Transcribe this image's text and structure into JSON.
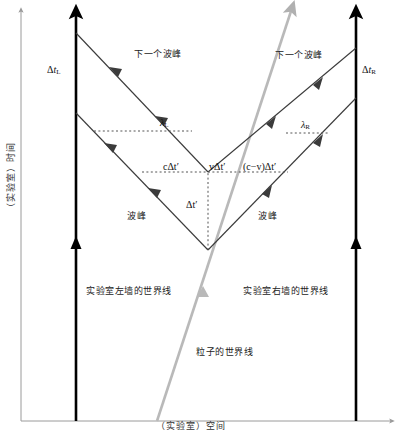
{
  "figure": {
    "type": "spacetime-diagram",
    "axes": {
      "y_label": "（实验室）时间",
      "x_label": "（实验室）空间"
    },
    "labels": {
      "dt_left": {
        "delta": "Δ",
        "t": "t",
        "sub": "L"
      },
      "dt_right": {
        "delta": "Δ",
        "t": "t",
        "sub": "R"
      },
      "lambda_left": {
        "sym": "λ",
        "sub": "L"
      },
      "lambda_right": {
        "sym": "λ",
        "sub": "R"
      },
      "c_dt_prime": "cΔt′",
      "v_dt_prime": "vΔt′",
      "c_minus_v_dt_prime": "(c−v)Δt′",
      "dt_prime": "Δt′",
      "next_crest_left": "下一个波峰",
      "next_crest_right": "下一个波峰",
      "crest_left": "波峰",
      "crest_right": "波峰",
      "worldline_left_wall": "实验室左墙的世界线",
      "worldline_right_wall": "实验室右墙的世界线",
      "worldline_particle": "粒子的世界线"
    },
    "colors": {
      "wall_line": "#000000",
      "light_ray": "#3b3b3b",
      "particle_line": "#b0b0b0",
      "dashed_guide": "#555555",
      "axis": "#9a9a9a",
      "background": "#ffffff"
    },
    "geometry": {
      "left_wall_x": 76,
      "right_wall_x": 356,
      "baseline_y": 421,
      "vertex": {
        "x": 208,
        "y": 250
      },
      "upper_crossing": {
        "x": 208,
        "y": 172
      },
      "particle_start": {
        "x": 157,
        "y": 421
      },
      "particle_end": {
        "x": 292,
        "y": 5
      }
    }
  }
}
